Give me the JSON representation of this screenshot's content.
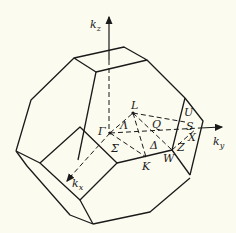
{
  "diagram": {
    "axes": {
      "kz": {
        "label": "k",
        "sub": "z"
      },
      "ky": {
        "label": "k",
        "sub": "y"
      },
      "kx": {
        "label": "k",
        "sub": "x"
      }
    },
    "points": {
      "gamma": "Γ",
      "L": "L",
      "K": "K",
      "W": "W",
      "X": "X",
      "U": "U"
    },
    "lines": {
      "lambda": "Λ",
      "delta": "Δ",
      "sigma": "Σ",
      "Q": "Q",
      "S": "S",
      "Z": "Z"
    },
    "colors": {
      "background": "#fcfbf0",
      "line": "#1a1a1a"
    }
  }
}
